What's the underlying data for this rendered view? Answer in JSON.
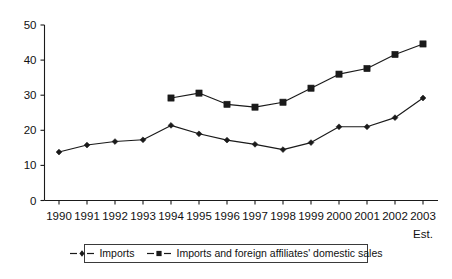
{
  "chart_data": {
    "type": "line",
    "title": "",
    "subtitle": "",
    "xlabel": "",
    "ylabel": "",
    "xlim_note": "1990-2003",
    "ylim": [
      0,
      50
    ],
    "ytick_values": [
      0,
      10,
      20,
      30,
      40,
      50
    ],
    "ytick_labels": [
      "0",
      "10",
      "20",
      "30",
      "40",
      "50"
    ],
    "grid": false,
    "legend_position": "bottom-center",
    "categories": [
      "1990",
      "1991",
      "1992",
      "1993",
      "1994",
      "1995",
      "1996",
      "1997",
      "1998",
      "1999",
      "2000",
      "2001",
      "2002",
      "2003"
    ],
    "x": [
      1990,
      1991,
      1992,
      1993,
      1994,
      1995,
      1996,
      1997,
      1998,
      1999,
      2000,
      2001,
      2002,
      2003
    ],
    "series": [
      {
        "name": "Imports",
        "marker": "diamond",
        "color": "#1a1a1a",
        "values": [
          13.8,
          15.8,
          16.8,
          17.3,
          21.4,
          19.0,
          17.2,
          16.0,
          14.5,
          16.5,
          21.0,
          21.0,
          23.6,
          29.2
        ]
      },
      {
        "name": "Imports and foreign affiliates' domestic sales",
        "marker": "square",
        "color": "#1a1a1a",
        "values": [
          null,
          null,
          null,
          null,
          29.2,
          30.6,
          27.4,
          26.6,
          28.0,
          32.0,
          36.0,
          37.6,
          41.6,
          44.6
        ]
      }
    ],
    "annotations": [
      {
        "text": "Est.",
        "x": 2003,
        "placement": "below-xaxis-label"
      }
    ]
  },
  "legend": {
    "entries": [
      {
        "label": "Imports",
        "marker": "diamond"
      },
      {
        "label": "Imports and foreign affiliates' domestic sales",
        "marker": "square"
      }
    ]
  },
  "axis": {
    "est_note": "Est."
  }
}
